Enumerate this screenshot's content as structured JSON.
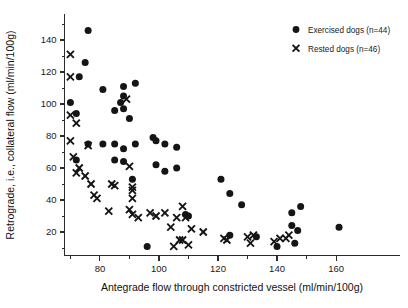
{
  "chart_data": {
    "type": "scatter",
    "title": "",
    "xlabel": "Antegrade flow through constricted vessel (ml/min/100g)",
    "ylabel": "Retrograde, i.e., collateral flow (ml/min/100g)",
    "xlim": [
      68,
      167
    ],
    "ylim": [
      8,
      152
    ],
    "xticks": [
      80,
      100,
      120,
      140,
      160
    ],
    "xticks_minor": [
      70,
      90,
      110,
      130,
      150
    ],
    "yticks": [
      20,
      40,
      60,
      80,
      100,
      120,
      140
    ],
    "yticks_minor": [
      10,
      30,
      50,
      70,
      90,
      110,
      130,
      150
    ],
    "grid": false,
    "legend_position": "top-right",
    "series": [
      {
        "name": "Exercised dogs (n=44)",
        "marker": "circle",
        "color": "#151515",
        "points": [
          [
            76,
            146
          ],
          [
            75,
            126
          ],
          [
            73,
            117
          ],
          [
            70,
            101
          ],
          [
            72,
            94
          ],
          [
            81,
            109
          ],
          [
            88,
            111
          ],
          [
            92,
            113
          ],
          [
            88,
            105
          ],
          [
            85,
            96
          ],
          [
            87,
            101
          ],
          [
            88,
            97
          ],
          [
            90,
            91
          ],
          [
            72,
            65
          ],
          [
            76,
            75
          ],
          [
            81,
            75
          ],
          [
            85,
            75
          ],
          [
            88,
            72
          ],
          [
            92,
            75
          ],
          [
            85,
            65
          ],
          [
            88,
            64
          ],
          [
            91,
            53
          ],
          [
            98,
            79
          ],
          [
            99,
            77
          ],
          [
            102,
            75
          ],
          [
            106,
            73
          ],
          [
            99,
            62
          ],
          [
            102,
            58
          ],
          [
            106,
            60
          ],
          [
            110,
            30
          ],
          [
            109,
            31
          ],
          [
            96,
            11
          ],
          [
            121,
            53
          ],
          [
            124,
            44
          ],
          [
            128,
            37
          ],
          [
            140,
            11
          ],
          [
            145,
            32
          ],
          [
            148,
            36
          ],
          [
            145,
            24
          ],
          [
            147,
            21
          ],
          [
            146,
            13
          ],
          [
            161,
            23
          ],
          [
            124,
            18
          ],
          [
            133,
            17
          ]
        ]
      },
      {
        "name": "Rested dogs (n=46)",
        "marker": "cross",
        "color": "#151515",
        "points": [
          [
            70,
            131
          ],
          [
            70,
            117
          ],
          [
            70,
            93
          ],
          [
            72,
            88
          ],
          [
            70,
            77
          ],
          [
            71,
            67
          ],
          [
            73,
            60
          ],
          [
            72,
            57
          ],
          [
            75,
            55
          ],
          [
            76,
            74
          ],
          [
            77,
            50
          ],
          [
            78,
            43
          ],
          [
            79,
            41
          ],
          [
            84,
            50
          ],
          [
            85,
            49
          ],
          [
            89,
            103
          ],
          [
            90,
            61
          ],
          [
            91,
            48
          ],
          [
            91,
            46
          ],
          [
            91,
            41
          ],
          [
            83,
            33
          ],
          [
            90,
            34
          ],
          [
            91,
            31
          ],
          [
            93,
            29
          ],
          [
            97,
            32
          ],
          [
            104,
            23
          ],
          [
            105,
            11
          ],
          [
            107,
            15
          ],
          [
            108,
            15
          ],
          [
            108,
            36
          ],
          [
            109,
            29
          ],
          [
            106,
            29
          ],
          [
            110,
            12
          ],
          [
            111,
            22
          ],
          [
            115,
            20
          ],
          [
            122,
            16
          ],
          [
            123,
            15
          ],
          [
            130,
            17
          ],
          [
            132,
            18
          ],
          [
            131,
            13
          ],
          [
            139,
            14
          ],
          [
            141,
            16
          ],
          [
            143,
            16
          ],
          [
            144,
            18
          ],
          [
            102,
            32
          ],
          [
            99,
            30
          ]
        ]
      }
    ]
  },
  "legend": {
    "items": [
      {
        "label": "Exercised dogs (n=44)",
        "marker": "circle"
      },
      {
        "label": "Rested dogs (n=46)",
        "marker": "cross"
      }
    ]
  },
  "axes": {
    "x_title": "Antegrade flow through constricted vessel (ml/min/100g)",
    "y_title": "Retrograde, i.e., collateral flow (ml/min/100g)",
    "x_tick_labels": [
      "80",
      "100",
      "120",
      "140",
      "160"
    ],
    "y_tick_labels": [
      "20",
      "40",
      "60",
      "80",
      "100",
      "120",
      "140"
    ]
  }
}
